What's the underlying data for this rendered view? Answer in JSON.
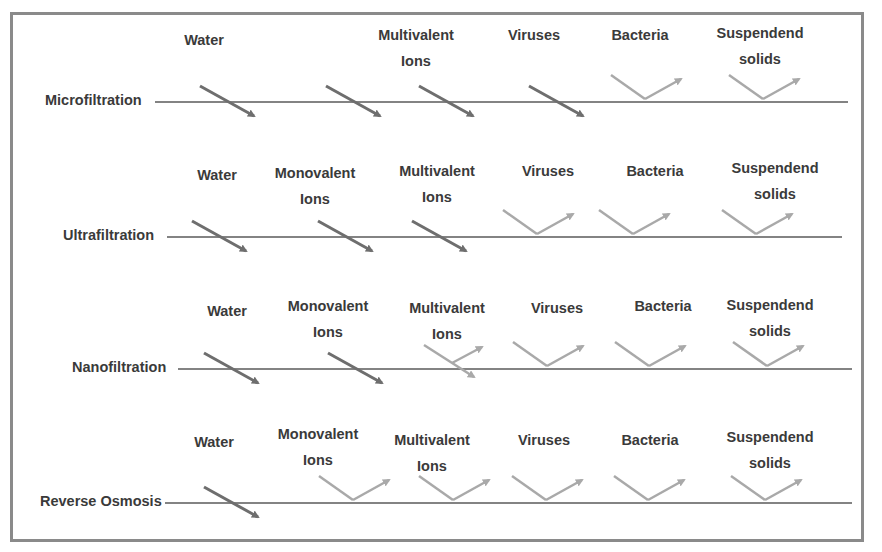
{
  "diagram": {
    "title": "",
    "colors": {
      "pass": "#6e6e6e",
      "reject": "#a9a9a9",
      "line": "#5a5a5a",
      "text": "#3a3a3a",
      "border": "#8a8a8a"
    },
    "rows": [
      {
        "name": "Microfiltration",
        "line_y": 102,
        "label_x": 45,
        "line_x1": 155,
        "line_x2": 848,
        "items": [
          {
            "label": [
              "Water"
            ],
            "x": 204,
            "ly": 27,
            "passes": true,
            "ax": 228
          },
          {
            "label": [
              "Multivalent",
              "Ions"
            ],
            "x": 416,
            "ly": 22,
            "passes": true,
            "ax": 354
          },
          {
            "label": [
              "Multivalent ions (arrow)"
            ],
            "x": 448,
            "ly": 0,
            "passes": true,
            "ax": 447,
            "hidden_label": true
          },
          {
            "label": [
              "Viruses"
            ],
            "x": 534,
            "ly": 22,
            "passes": true,
            "ax": 557
          },
          {
            "label": [
              "Bacteria"
            ],
            "x": 640,
            "ly": 22,
            "passes": false,
            "ax": 647
          },
          {
            "label": [
              "Suspendend",
              "solids"
            ],
            "x": 760,
            "ly": 20,
            "passes": false,
            "ax": 765
          }
        ]
      },
      {
        "name": "Ultrafiltration",
        "line_y": 237,
        "label_x": 63,
        "line_x1": 167,
        "line_x2": 842,
        "items": [
          {
            "label": [
              "Water"
            ],
            "x": 217,
            "ly": 162,
            "passes": true,
            "ax": 220
          },
          {
            "label": [
              "Monovalent",
              "Ions"
            ],
            "x": 315,
            "ly": 160,
            "passes": true,
            "ax": 346
          },
          {
            "label": [
              "Multivalent",
              "Ions"
            ],
            "x": 437,
            "ly": 158,
            "passes": true,
            "ax": 440
          },
          {
            "label": [
              "Viruses"
            ],
            "x": 548,
            "ly": 158,
            "passes": false,
            "ax": 539
          },
          {
            "label": [
              "Bacteria"
            ],
            "x": 655,
            "ly": 158,
            "passes": false,
            "ax": 635
          },
          {
            "label": [
              "Suspendend",
              "solids"
            ],
            "x": 775,
            "ly": 155,
            "passes": false,
            "ax": 758
          }
        ]
      },
      {
        "name": "Nanofiltration",
        "line_y": 369,
        "label_x": 72,
        "line_x1": 178,
        "line_x2": 852,
        "items": [
          {
            "label": [
              "Water"
            ],
            "x": 227,
            "ly": 298,
            "passes": true,
            "ax": 232
          },
          {
            "label": [
              "Monovalent",
              "Ions"
            ],
            "x": 328,
            "ly": 293,
            "passes": true,
            "ax": 356
          },
          {
            "label": [
              "Multivalent",
              "Ions"
            ],
            "x": 447,
            "ly": 295,
            "passes": "partial",
            "ax": 456
          },
          {
            "label": [
              "Viruses"
            ],
            "x": 557,
            "ly": 295,
            "passes": false,
            "ax": 549
          },
          {
            "label": [
              "Bacteria"
            ],
            "x": 663,
            "ly": 293,
            "passes": false,
            "ax": 651
          },
          {
            "label": [
              "Suspendend",
              "solids"
            ],
            "x": 770,
            "ly": 292,
            "passes": false,
            "ax": 769
          }
        ]
      },
      {
        "name": "Reverse Osmosis",
        "line_y": 503,
        "label_x": 40,
        "line_x1": 165,
        "line_x2": 852,
        "items": [
          {
            "label": [
              "Water"
            ],
            "x": 214,
            "ly": 429,
            "passes": true,
            "ax": 232
          },
          {
            "label": [
              "Monovalent",
              "Ions"
            ],
            "x": 318,
            "ly": 421,
            "passes": false,
            "ax": 355
          },
          {
            "label": [
              "Multivalent",
              "Ions"
            ],
            "x": 432,
            "ly": 427,
            "passes": false,
            "ax": 455
          },
          {
            "label": [
              "Viruses"
            ],
            "x": 544,
            "ly": 427,
            "passes": false,
            "ax": 548
          },
          {
            "label": [
              "Bacteria"
            ],
            "x": 650,
            "ly": 427,
            "passes": false,
            "ax": 650
          },
          {
            "label": [
              "Suspendend",
              "solids"
            ],
            "x": 770,
            "ly": 424,
            "passes": false,
            "ax": 767
          }
        ]
      }
    ]
  }
}
